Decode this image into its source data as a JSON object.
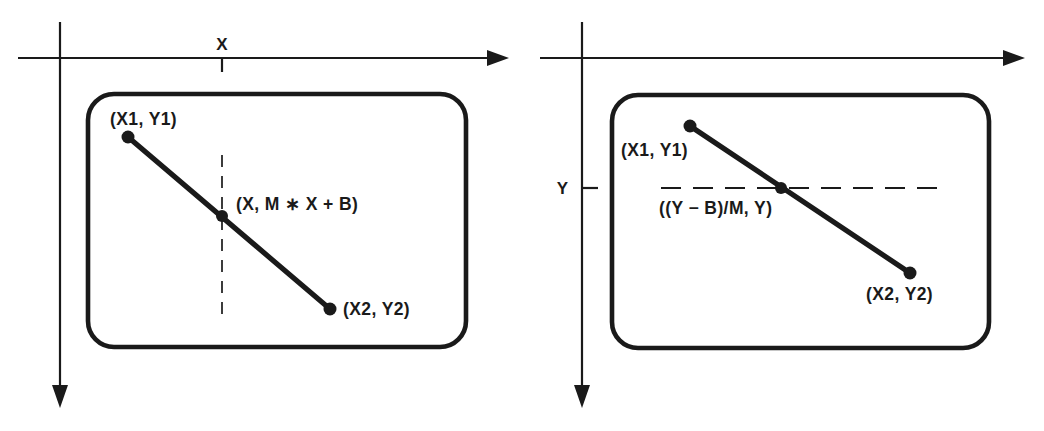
{
  "figure": {
    "background_color": "#ffffff",
    "ink_color": "#1a1a1a",
    "width": 1044,
    "height": 431
  },
  "panels": [
    {
      "id": "left-panel",
      "name": "solve-for-y-given-x",
      "axis": {
        "horizontal_label": "X",
        "vertical_label": "",
        "horizontal_arrow": "right",
        "vertical_arrow": "down",
        "tick_orientation": "vertical-on-horizontal-axis"
      },
      "guide": {
        "orientation": "vertical",
        "style": "dashed"
      },
      "labels": {
        "point1": "(X1, Y1)",
        "intersection": "(X, M ∗ X + B)",
        "point2": "(X2, Y2)"
      },
      "points": {
        "point1": {
          "x": 128,
          "y": 137
        },
        "intersection": {
          "x": 222,
          "y": 216
        },
        "point2": {
          "x": 330,
          "y": 309
        }
      }
    },
    {
      "id": "right-panel",
      "name": "solve-for-x-given-y",
      "axis": {
        "horizontal_label": "",
        "vertical_label": "Y",
        "horizontal_arrow": "right",
        "vertical_arrow": "down",
        "tick_orientation": "horizontal-on-vertical-axis"
      },
      "guide": {
        "orientation": "horizontal",
        "style": "dashed"
      },
      "labels": {
        "point1": "(X1, Y1)",
        "intersection": "((Y − B)/M, Y)",
        "point2": "(X2, Y2)"
      },
      "points": {
        "point1": {
          "x": 690,
          "y": 126
        },
        "intersection": {
          "x": 781,
          "y": 188
        },
        "point2": {
          "x": 910,
          "y": 273
        }
      }
    }
  ]
}
